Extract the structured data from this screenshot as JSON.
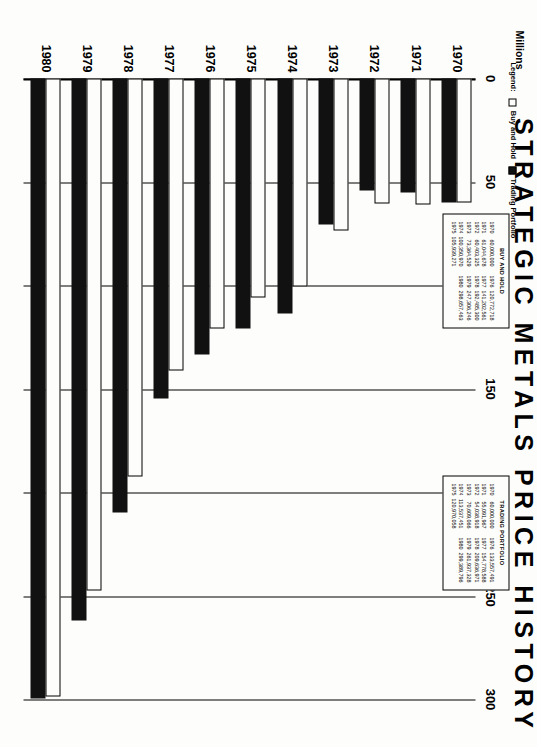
{
  "title": "STRATEGIC METALS PRICE HISTORY",
  "legend": {
    "prefix": "Legend:",
    "hold_label": "Buy and Hold",
    "trade_label": "Trading Portfolio"
  },
  "chart_data": {
    "type": "bar",
    "orientation": "horizontal",
    "title": "STRATEGIC METALS PRICE HISTORY",
    "xlabel": "Millions",
    "ylabel": "",
    "units_label": "Millions",
    "xlim": [
      0,
      300
    ],
    "xticks": [
      0,
      50,
      100,
      150,
      200,
      250,
      300
    ],
    "xtick_labels": [
      "0",
      "50",
      "100",
      "150",
      "200",
      "250",
      "300"
    ],
    "grid": true,
    "legend_position": "top-left",
    "categories": [
      "1970",
      "1971",
      "1972",
      "1973",
      "1974",
      "1975",
      "1976",
      "1977",
      "1978",
      "1979",
      "1980"
    ],
    "series": [
      {
        "name": "Buy and Hold",
        "color": "#ffffff",
        "values": [
          60.0,
          61.045,
          60.403,
          73.365,
          100.351,
          105.939,
          120.773,
          141.203,
          192.485,
          247.306,
          298.657
        ]
      },
      {
        "name": "Trading Portfolio",
        "color": "#111111",
        "values": [
          60.0,
          55.092,
          54.039,
          70.609,
          113.537,
          120.97,
          133.557,
          154.779,
          209.637,
          261.937,
          299.39
        ]
      }
    ]
  },
  "tables": {
    "buy_and_hold": {
      "title": "BUY AND HOLD",
      "left": [
        {
          "year": "1970",
          "value": "60,000,000"
        },
        {
          "year": "1971",
          "value": "61,044,678"
        },
        {
          "year": "1972",
          "value": "60,403,325"
        },
        {
          "year": "1973",
          "value": "73,364,529"
        },
        {
          "year": "1974",
          "value": "100,350,970"
        },
        {
          "year": "1975",
          "value": "105,939,271"
        }
      ],
      "right": [
        {
          "year": "1976",
          "value": "120,772,718"
        },
        {
          "year": "1977",
          "value": "141,202,561"
        },
        {
          "year": "1978",
          "value": "192,485,300"
        },
        {
          "year": "1979",
          "value": "247,306,246"
        },
        {
          "year": "1980",
          "value": "298,657,463"
        }
      ]
    },
    "trading_portfolio": {
      "title": "TRADING PORTFOLIO",
      "left": [
        {
          "year": "1970",
          "value": "60,000,000"
        },
        {
          "year": "1971",
          "value": "55,091,967"
        },
        {
          "year": "1972",
          "value": "54,038,918"
        },
        {
          "year": "1973",
          "value": "70,609,066"
        },
        {
          "year": "1974",
          "value": "113,537,451"
        },
        {
          "year": "1975",
          "value": "120,970,058"
        }
      ],
      "right": [
        {
          "year": "1976",
          "value": "133,557,491"
        },
        {
          "year": "1977",
          "value": "154,778,588"
        },
        {
          "year": "1978",
          "value": "209,636,971"
        },
        {
          "year": "1979",
          "value": "261,937,328"
        },
        {
          "year": "1980",
          "value": "299,389,796"
        }
      ]
    }
  }
}
